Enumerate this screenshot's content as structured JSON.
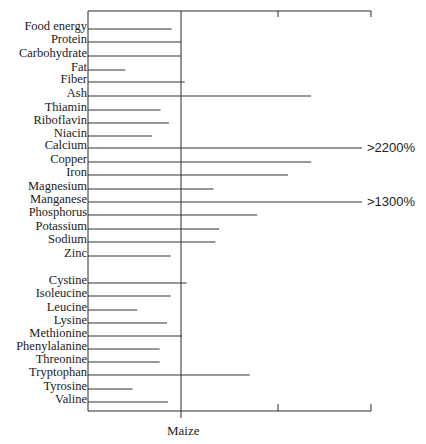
{
  "chart_data": {
    "type": "bar",
    "orientation": "horizontal",
    "title": "",
    "xlabel": "",
    "ylabel": "",
    "reference": {
      "label": "Maize",
      "value": 100
    },
    "x_ticks": [
      100,
      200,
      300
    ],
    "xlim": [
      0,
      300
    ],
    "units": "% of maize",
    "grid": false,
    "legend": null,
    "groups": [
      {
        "name": "Nutrients",
        "categories": [
          "Food energy",
          "Protein",
          "Carbohydrate",
          "Fat",
          "Fiber",
          "Ash",
          "Thiamin",
          "Riboflavin",
          "Niacin",
          "Calcium",
          "Copper",
          "Iron",
          "Magnesium",
          "Manganese",
          "Phosphorus",
          "Potassium",
          "Sodium",
          "Zinc"
        ],
        "values": [
          90,
          100,
          100,
          40,
          104,
          240,
          78,
          87,
          69,
          2200,
          240,
          215,
          135,
          1300,
          182,
          141,
          137,
          89
        ]
      },
      {
        "name": "Amino acids",
        "categories": [
          "Cystine",
          "Isoleucine",
          "Leucine",
          "Lysine",
          "Methionine",
          "Phenylalanine",
          "Threonine",
          "Tryptophan",
          "Tyrosine",
          "Valine"
        ],
        "values": [
          106,
          89,
          53,
          85,
          101,
          77,
          77,
          174,
          48,
          86
        ]
      }
    ],
    "annotations": [
      {
        "category": "Calcium",
        "text": ">2200%"
      },
      {
        "category": "Manganese",
        "text": ">1300%"
      }
    ]
  },
  "labels": {
    "rows": [
      "Food energy",
      "Protein",
      "Carbohydrate",
      "Fat",
      "Fiber",
      "Ash",
      "Thiamin",
      "Riboflavin",
      "Niacin",
      "Calcium",
      "Copper",
      "Iron",
      "Magnesium",
      "Manganese",
      "Phosphorus",
      "Potassium",
      "Sodium",
      "Zinc",
      "Cystine",
      "Isoleucine",
      "Leucine",
      "Lysine",
      "Methionine",
      "Phenylalanine",
      "Threonine",
      "Tryptophan",
      "Tyrosine",
      "Valine"
    ],
    "calcium_overflow": ">2200%",
    "manganese_overflow": ">1300%",
    "x_reference": "Maize"
  }
}
